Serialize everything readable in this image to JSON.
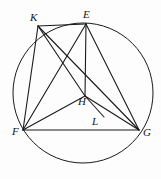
{
  "figure": {
    "background_color": "#fdfdfd",
    "stroke_color": "#1a1a1a",
    "label_color": "#161616"
  },
  "circle": {
    "name": "circumcircle",
    "center_x": 83,
    "center_y": 93,
    "radius": 70,
    "stroke_width": 1.0
  },
  "points": [
    {
      "id": "K",
      "label": "K",
      "x": 38,
      "y": 26,
      "label_x": 30,
      "label_y": 12,
      "on_circle": true
    },
    {
      "id": "E",
      "label": "E",
      "x": 86,
      "y": 24,
      "label_x": 83,
      "label_y": 9,
      "on_circle": true
    },
    {
      "id": "F",
      "label": "F",
      "x": 23,
      "y": 130,
      "label_x": 12,
      "label_y": 126,
      "on_circle": true
    },
    {
      "id": "G",
      "label": "G",
      "x": 139,
      "y": 130,
      "label_x": 143,
      "label_y": 127,
      "on_circle": true
    },
    {
      "id": "H",
      "label": "H",
      "x": 85,
      "y": 96,
      "label_x": 78,
      "label_y": 96,
      "on_circle": false
    },
    {
      "id": "L",
      "label": "L",
      "x": 104,
      "y": 117,
      "label_x": 92,
      "label_y": 116,
      "on_circle": false
    }
  ],
  "segments": [
    {
      "id": "KE",
      "from": "K",
      "to": "E",
      "name": "segment-k-e"
    },
    {
      "id": "KF",
      "from": "K",
      "to": "F",
      "name": "segment-k-f"
    },
    {
      "id": "KG",
      "from": "K",
      "to": "G",
      "name": "segment-k-g"
    },
    {
      "id": "KH",
      "from": "K",
      "to": "H",
      "name": "segment-k-h"
    },
    {
      "id": "EF",
      "from": "E",
      "to": "F",
      "name": "segment-e-f"
    },
    {
      "id": "EH",
      "from": "E",
      "to": "H",
      "name": "segment-e-h"
    },
    {
      "id": "EG",
      "from": "E",
      "to": "G",
      "name": "segment-e-g"
    },
    {
      "id": "FG",
      "from": "F",
      "to": "G",
      "name": "segment-f-g"
    },
    {
      "id": "FH",
      "from": "F",
      "to": "H",
      "name": "segment-f-h"
    },
    {
      "id": "HG",
      "from": "H",
      "to": "G",
      "name": "segment-h-g"
    },
    {
      "id": "HL",
      "from": "H",
      "to": "L",
      "name": "segment-h-l"
    }
  ]
}
